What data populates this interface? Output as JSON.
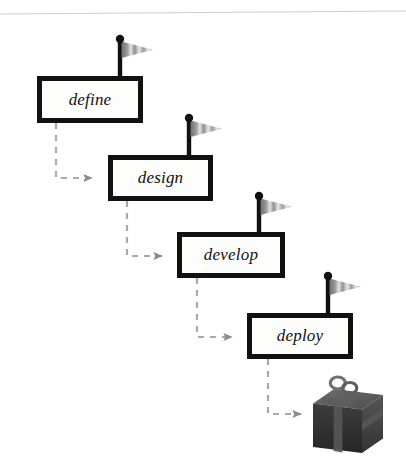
{
  "diagram": {
    "type": "process-flow",
    "background_color": "#ffffff",
    "top_rule": {
      "name": "top-divider-line",
      "color": "#c9cdd4",
      "x1": 0,
      "y1": 14,
      "x2": 406,
      "y2": 11
    },
    "style": {
      "box_fill": "#fdfdfb",
      "box_border_color": "#111111",
      "box_border_width": 5,
      "label_color": "#111111",
      "connector_color": "#a9a9a9",
      "arrowhead_color": "#8c8c8c",
      "flag_pole_color": "#111111",
      "flag_knob_color": "#111111",
      "flag_light": "#e2e2e2",
      "flag_mid": "#b4b4b4",
      "flag_dark": "#6f6f6f",
      "gift_dark": "#2f2f2f",
      "gift_mid": "#4a4a4a",
      "gift_light": "#6b6b6b",
      "ribbon_color": "#565656"
    },
    "nodes": [
      {
        "id": "define",
        "label": "define",
        "x": 37,
        "y": 76,
        "w": 106,
        "h": 47,
        "flag": {
          "x": 120,
          "y": 35,
          "height": 41
        }
      },
      {
        "id": "design",
        "label": "design",
        "x": 108,
        "y": 155,
        "w": 105,
        "h": 46,
        "flag": {
          "x": 189,
          "y": 114,
          "height": 41
        }
      },
      {
        "id": "develop",
        "label": "develop",
        "x": 177,
        "y": 232,
        "w": 108,
        "h": 46,
        "flag": {
          "x": 259,
          "y": 192,
          "height": 40
        }
      },
      {
        "id": "deploy",
        "label": "deploy",
        "x": 247,
        "y": 313,
        "w": 106,
        "h": 46,
        "flag": {
          "x": 328,
          "y": 272,
          "height": 41
        }
      }
    ],
    "connectors": [
      {
        "id": "define-to-design",
        "from": "define",
        "to": "design",
        "start_x": 56,
        "start_y": 123,
        "corner_y": 178,
        "end_x": 104
      },
      {
        "id": "design-to-develop",
        "from": "design",
        "to": "develop",
        "start_x": 127,
        "start_y": 201,
        "corner_y": 256,
        "end_x": 174
      },
      {
        "id": "develop-to-deploy",
        "from": "develop",
        "to": "deploy",
        "start_x": 197,
        "start_y": 278,
        "corner_y": 337,
        "end_x": 244
      },
      {
        "id": "deploy-to-deliverable",
        "from": "deploy",
        "to": "deliverable",
        "start_x": 268,
        "start_y": 359,
        "corner_y": 414,
        "end_x": 313
      }
    ],
    "deliverable": {
      "id": "deliverable",
      "name": "gift-box",
      "label": "",
      "x": 313,
      "y": 381,
      "w": 70,
      "h": 72
    }
  }
}
